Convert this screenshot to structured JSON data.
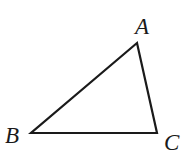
{
  "diagram": {
    "type": "triangle",
    "stroke_color": "#1a1a1a",
    "background": "#ffffff",
    "vertices": {
      "A": {
        "label": "A",
        "x": 137,
        "y": 43
      },
      "B": {
        "label": "B",
        "x": 31,
        "y": 133
      },
      "C": {
        "label": "C",
        "x": 157,
        "y": 133
      }
    },
    "labels": [
      {
        "id": "A",
        "text": "A",
        "x": 135,
        "y": 34
      },
      {
        "id": "B",
        "text": "B",
        "x": 5,
        "y": 143
      },
      {
        "id": "C",
        "text": "C",
        "x": 164,
        "y": 150
      }
    ],
    "edges": [
      {
        "from": "A",
        "to": "B"
      },
      {
        "from": "B",
        "to": "C"
      },
      {
        "from": "C",
        "to": "A"
      }
    ]
  }
}
